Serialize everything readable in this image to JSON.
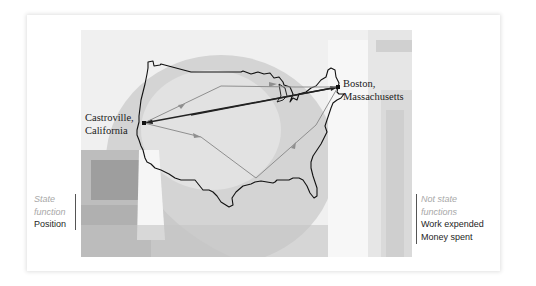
{
  "figure": {
    "left_annotation": {
      "category": [
        "State",
        "function"
      ],
      "items": [
        "Position"
      ]
    },
    "right_annotation": {
      "category": [
        "Not state",
        "functions"
      ],
      "items": [
        "Work expended",
        "Money spent"
      ]
    },
    "map": {
      "origin_label": [
        "Castroville,",
        "California"
      ],
      "destination_label": [
        "Boston,",
        "Massachusetts"
      ],
      "routes": [
        {
          "name": "direct-route",
          "style": "dark"
        },
        {
          "name": "northern-route",
          "style": "gray"
        },
        {
          "name": "southern-route",
          "style": "gray"
        }
      ]
    },
    "colors": {
      "muted_text": "#a8a8a8",
      "dark_text": "#1e1e1e",
      "map_outline": "#111111",
      "route_gray": "#8f8f8f"
    }
  }
}
